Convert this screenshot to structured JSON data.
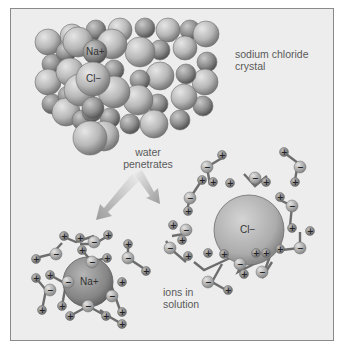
{
  "figure": {
    "labels": {
      "crystal": [
        "sodium chloride",
        "crystal"
      ],
      "process": [
        "water",
        "penetrates"
      ],
      "solution": [
        "ions in",
        "solution"
      ]
    },
    "ions": {
      "crystal_na": "Na+",
      "crystal_cl": "Cl−",
      "solution_na": "Na+",
      "solution_cl": "Cl−"
    },
    "water_signs": {
      "positive": "+",
      "negative": "−"
    },
    "colors": {
      "background": "#ededed",
      "frame_border": "#8a8a8a",
      "cl_sphere": "#bdbdbd",
      "na_sphere": "#8f8f8f",
      "arrow": "#a8a8a8",
      "text": "#5a5a5a"
    }
  }
}
